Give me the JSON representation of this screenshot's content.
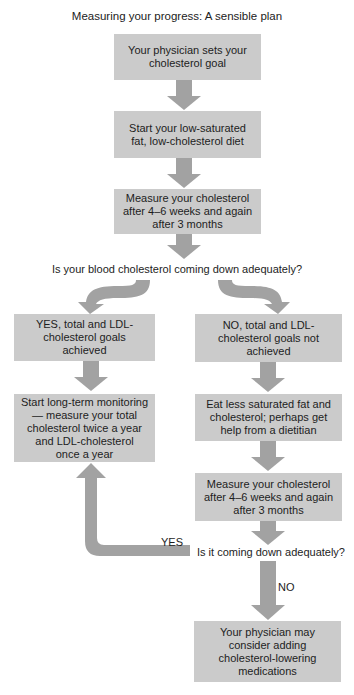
{
  "diagram": {
    "title": "Measuring your progress: A sensible plan",
    "steps": {
      "set_goal": "Your physician sets your\ncholesterol goal",
      "start_diet": "Start your low-saturated\nfat, low-cholesterol diet",
      "measure_1": "Measure your cholesterol\nafter 4–6 weeks and again\nafter 3 months",
      "question_1": "Is your blood cholesterol coming down adequately?",
      "yes_branch": "YES, total and LDL-\ncholesterol goals achieved",
      "no_branch": "NO, total and LDL-\ncholesterol goals not\nachieved",
      "long_term_monitoring": "Start long-term monitoring\n— measure your total\ncholesterol twice a year\nand LDL-cholesterol\nonce a year",
      "eat_less": "Eat less saturated fat and\ncholesterol; perhaps get\nhelp from a dietitian",
      "measure_2": "Measure your cholesterol\nafter 4–6 weeks and again\nafter 3 months",
      "question_2": "Is it coming down adequately?",
      "medications": "Your physician may\nconsider adding\ncholesterol-lowering\nmedications"
    },
    "edge_labels": {
      "yes": "YES",
      "no": "NO"
    },
    "colors": {
      "box_fill": "#cbcbcb",
      "arrow_fill": "#a2a2a2"
    }
  }
}
